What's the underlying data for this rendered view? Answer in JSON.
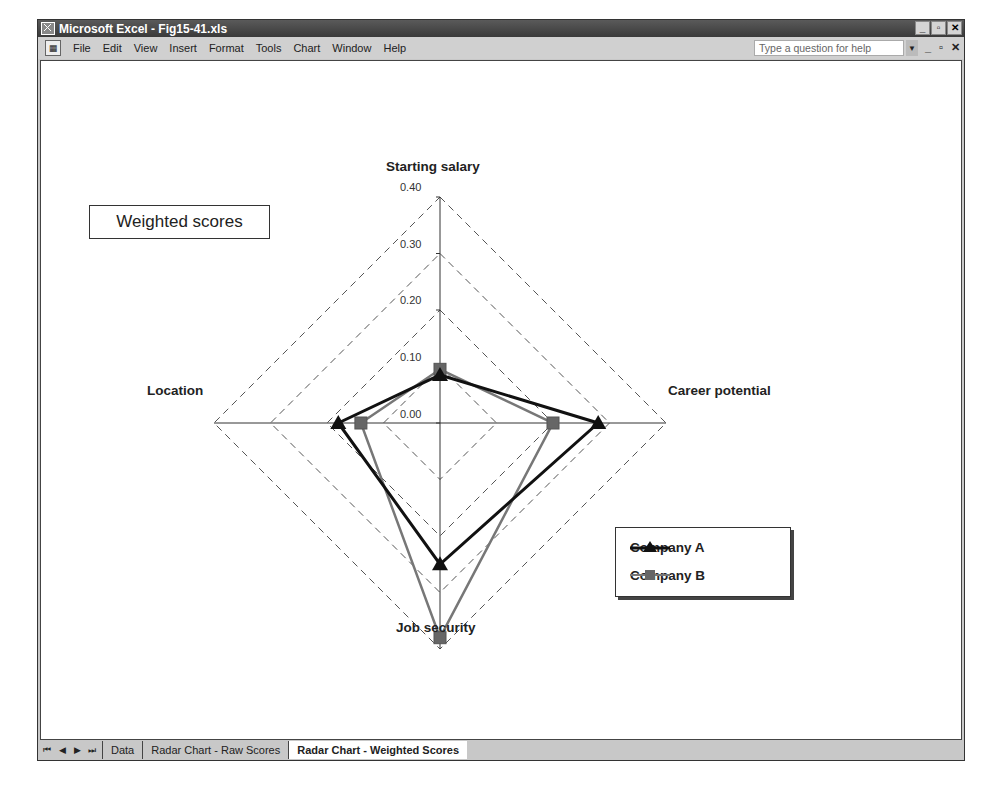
{
  "window": {
    "title": "Microsoft Excel - Fig15-41.xls",
    "controls": {
      "minimize": "_",
      "restore": "▫",
      "close": "✕"
    }
  },
  "menubar": {
    "items": [
      {
        "label": "File",
        "accel": "F"
      },
      {
        "label": "Edit",
        "accel": "E"
      },
      {
        "label": "View",
        "accel": "V"
      },
      {
        "label": "Insert",
        "accel": "I"
      },
      {
        "label": "Format",
        "accel": "o"
      },
      {
        "label": "Tools",
        "accel": "T"
      },
      {
        "label": "Chart",
        "accel": "C"
      },
      {
        "label": "Window",
        "accel": "W"
      },
      {
        "label": "Help",
        "accel": "H"
      }
    ],
    "help_placeholder": "Type a question for help",
    "doc_controls": {
      "minimize": "_",
      "restore": "▫",
      "close": "✕"
    }
  },
  "chart_data": {
    "type": "radar",
    "title": "Weighted scores",
    "axes": [
      "Starting salary",
      "Career potential",
      "Job security",
      "Location"
    ],
    "ticks": [
      "0.00",
      "0.10",
      "0.20",
      "0.30",
      "0.40"
    ],
    "range": [
      0,
      0.4
    ],
    "gridlines": "dashed",
    "legend_position": "lower right",
    "series": [
      {
        "name": "Company A",
        "values": [
          0.085,
          0.28,
          0.25,
          0.18
        ],
        "color": "#111111",
        "marker": "triangle"
      },
      {
        "name": "Company B",
        "values": [
          0.095,
          0.2,
          0.38,
          0.14
        ],
        "color": "#777777",
        "marker": "square"
      }
    ]
  },
  "sheet_tabs": {
    "nav": [
      "⏮",
      "◀",
      "▶",
      "⏭"
    ],
    "tabs": [
      {
        "label": "Data",
        "active": false
      },
      {
        "label": "Radar Chart - Raw Scores",
        "active": false
      },
      {
        "label": "Radar Chart - Weighted Scores",
        "active": true
      }
    ]
  }
}
